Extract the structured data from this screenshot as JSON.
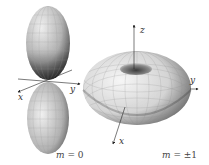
{
  "figure": {
    "panels": [
      {
        "id": "m0",
        "caption_var": "m",
        "caption_eq": " = 0",
        "shape": "dumbbell-lobes",
        "axes": {
          "x": "x",
          "y": "y"
        }
      },
      {
        "id": "m1",
        "caption_var": "m",
        "caption_eq": " = ±1",
        "shape": "torus",
        "axes": {
          "x": "x",
          "y": "y",
          "z": "z"
        }
      }
    ],
    "colors": {
      "surface_light": "#f2f2f2",
      "surface_dark": "#3a3a3a",
      "mesh": "#9a9a9a",
      "axis": "#222222",
      "background": "#ffffff"
    }
  }
}
